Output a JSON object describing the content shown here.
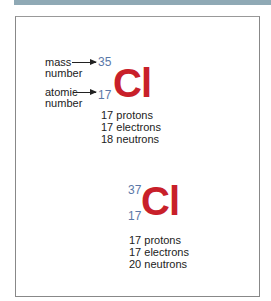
{
  "colors": {
    "top_band": "#8fa9b5",
    "frame_border": "#888888",
    "element_symbol": "#c8202a",
    "isotope_numbers": "#5a78a8",
    "text": "#222222"
  },
  "labels": {
    "mass_number": [
      "mass",
      "number"
    ],
    "atomic_number": [
      "atomic",
      "number"
    ]
  },
  "isotopes": [
    {
      "mass_number": "35",
      "atomic_number": "17",
      "symbol": "Cl",
      "facts": [
        "17 protons",
        "17 electrons",
        "18 neutrons"
      ]
    },
    {
      "mass_number": "37",
      "atomic_number": "17",
      "symbol": "Cl",
      "facts": [
        "17 protons",
        "17 electrons",
        "20 neutrons"
      ]
    }
  ]
}
